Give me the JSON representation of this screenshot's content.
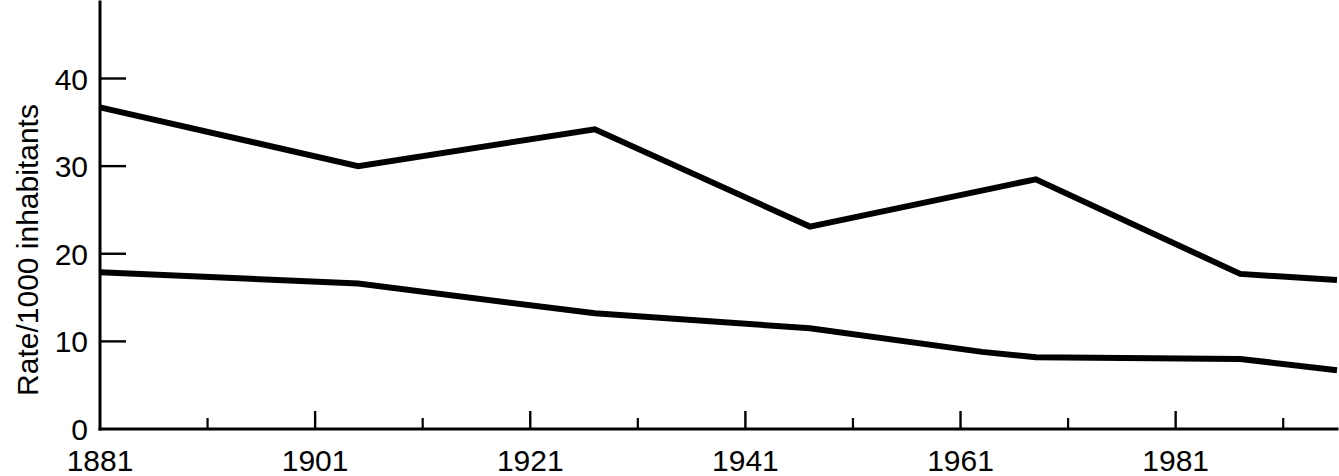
{
  "chart_data": {
    "type": "line",
    "title": "",
    "subtitle": "",
    "xlabel": "",
    "ylabel": "Rate/1000 inhabitants",
    "xlim": [
      1881,
      1996
    ],
    "ylim": [
      0,
      44
    ],
    "grid": false,
    "legend": "none",
    "y_ticks": [
      0,
      10,
      20,
      30,
      40
    ],
    "y_tick_labels": [
      "0",
      "10",
      "20",
      "30",
      "40"
    ],
    "x_major_ticks": [
      1891,
      1901,
      1911,
      1921,
      1931,
      1941,
      1951,
      1961,
      1971,
      1981,
      1991
    ],
    "x_tick_labels": [
      "1881",
      "1901",
      "1921",
      "1941",
      "1961",
      "1981"
    ],
    "x_label_years": [
      1881,
      1901,
      1921,
      1941,
      1961,
      1981
    ],
    "series": [
      {
        "name": "birth-rate",
        "x": [
          1881,
          1905,
          1927,
          1947,
          1968,
          1987,
          1996
        ],
        "values": [
          36.7,
          30.0,
          34.2,
          23.1,
          28.5,
          17.7,
          17.0
        ]
      },
      {
        "name": "death-rate",
        "x": [
          1881,
          1905,
          1927,
          1947,
          1963,
          1968,
          1987,
          1996
        ],
        "values": [
          17.9,
          16.6,
          13.2,
          11.5,
          8.8,
          8.2,
          8.0,
          6.7
        ]
      }
    ]
  },
  "axes": {
    "y_axis_name": "Rate/1000 inhabitants",
    "x_axis_name": ""
  }
}
